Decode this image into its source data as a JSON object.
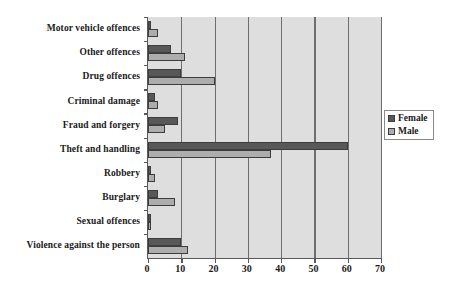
{
  "chart_data": {
    "type": "bar",
    "orientation": "horizontal",
    "title": "",
    "subtitle": "",
    "xlabel": "",
    "ylabel": "",
    "xlim": [
      0,
      70
    ],
    "xticks": [
      0,
      10,
      20,
      30,
      40,
      50,
      60,
      70
    ],
    "xtick_labels": [
      "0",
      "10",
      "20",
      "30",
      "40",
      "50",
      "60",
      "70"
    ],
    "grid": true,
    "grid_axis": "x",
    "legend_position": "right",
    "categories": [
      "Motor vehicle offences",
      "Other offences",
      "Drug offences",
      "Criminal damage",
      "Fraud and forgery",
      "Theft and handling",
      "Robbery",
      "Burglary",
      "Sexual offences",
      "Violence against the person"
    ],
    "series": [
      {
        "name": "Female",
        "color": "#585858",
        "values": [
          1,
          7,
          10,
          2,
          9,
          60,
          1,
          3,
          1,
          10
        ]
      },
      {
        "name": "Male",
        "color": "#adadad",
        "values": [
          3,
          11,
          20,
          3,
          5,
          37,
          2,
          8,
          1,
          12
        ]
      }
    ]
  },
  "legend": {
    "items": [
      {
        "label": "Female",
        "swatch": "female"
      },
      {
        "label": "Male",
        "swatch": "male"
      }
    ]
  },
  "colors": {
    "female": "#585858",
    "male": "#adadad",
    "plot_background": "#dedede",
    "gridline": "#6e6e6e",
    "axis": "#595959",
    "text": "#1a1a1a",
    "page_background": "#ffffff"
  }
}
